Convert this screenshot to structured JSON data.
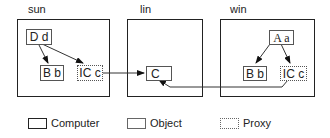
{
  "computers": [
    {
      "id": "sun",
      "label": "sun",
      "objects": [
        {
          "id": "Dd",
          "label": "D d",
          "kind": "object"
        },
        {
          "id": "Bb",
          "label": "B b",
          "kind": "object"
        },
        {
          "id": "ICc",
          "label": "IC c",
          "kind": "proxy"
        }
      ]
    },
    {
      "id": "lin",
      "label": "lin",
      "objects": [
        {
          "id": "C",
          "label": "C",
          "kind": "object"
        }
      ]
    },
    {
      "id": "win",
      "label": "win",
      "objects": [
        {
          "id": "Aa",
          "label": "A a",
          "kind": "object"
        },
        {
          "id": "Bb",
          "label": "B b",
          "kind": "object"
        },
        {
          "id": "ICc",
          "label": "IC c",
          "kind": "proxy"
        }
      ]
    }
  ],
  "edges": [
    {
      "from": "sun.Dd",
      "to": "sun.Bb"
    },
    {
      "from": "sun.Dd",
      "to": "sun.ICc"
    },
    {
      "from": "sun.ICc",
      "to": "lin.C"
    },
    {
      "from": "win.Aa",
      "to": "win.Bb"
    },
    {
      "from": "win.Aa",
      "to": "win.ICc"
    },
    {
      "from": "win.ICc",
      "to": "lin.C"
    }
  ],
  "legend": [
    {
      "label": "Computer",
      "style": "computer"
    },
    {
      "label": "Object",
      "style": "object"
    },
    {
      "label": "Proxy",
      "style": "proxy"
    }
  ]
}
